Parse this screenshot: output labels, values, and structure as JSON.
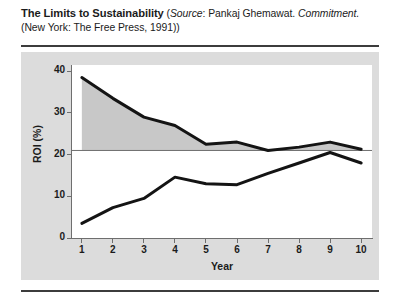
{
  "caption": {
    "title": "The Limits to Sustainability",
    "source_open": " (",
    "source_word": "Source",
    "source_colon": ": Pankaj Ghemawat. ",
    "work_title": "Commitment.",
    "publication": " (New York: The Free Press, 1991))"
  },
  "colors": {
    "panel_background": "#dcdcdc",
    "plot_background": "#ffffff",
    "shaded_region": "#c8c8c8",
    "curve": "#141414",
    "axis": "#6e6e6e",
    "rule": "#3c3c3c",
    "text": "#1b1b1b"
  },
  "chart_data": {
    "type": "line",
    "title": "The Limits to Sustainability",
    "xlabel": "Year",
    "ylabel": "ROI (%)",
    "x": [
      1,
      2,
      3,
      4,
      5,
      6,
      7,
      8,
      9,
      10
    ],
    "xtick_labels": [
      "1",
      "2",
      "3",
      "4",
      "5",
      "6",
      "7",
      "8",
      "9",
      "10"
    ],
    "ytick_labels": [
      "0",
      "10",
      "20",
      "30",
      "40"
    ],
    "yticks": [
      0,
      10,
      20,
      30,
      40
    ],
    "xlim": [
      0.65,
      10.35
    ],
    "ylim": [
      0,
      41.5
    ],
    "grid": false,
    "legend": false,
    "legend_position": "none",
    "reference_line": {
      "label": "cost of capital baseline",
      "value": 21,
      "orientation": "horizontal"
    },
    "fill": {
      "between_series": "Upper ROI",
      "and_reference": 21,
      "color": "#c8c8c8",
      "label": "economic profit region"
    },
    "series": [
      {
        "name": "Upper ROI",
        "values": [
          38.5,
          33.5,
          29.0,
          27.0,
          22.5,
          23.0,
          21.0,
          21.8,
          23.0,
          21.3
        ]
      },
      {
        "name": "Lower ROI",
        "values": [
          3.5,
          7.3,
          9.5,
          14.6,
          13.0,
          12.8,
          15.5,
          18.0,
          20.5,
          18.0
        ]
      }
    ]
  }
}
